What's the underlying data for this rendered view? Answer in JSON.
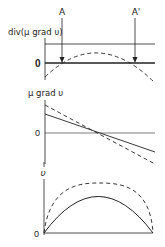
{
  "figure": {
    "colors": {
      "ink": "#222222",
      "background": "#ffffff"
    },
    "markers": [
      {
        "label": "A",
        "x": 62
      },
      {
        "label": "A'",
        "x": 135
      }
    ],
    "panels": [
      {
        "id": "top",
        "ylabel": "div(μ grad υ)",
        "zero_label": "0",
        "curves": [
          {
            "style": "dashed",
            "shape": "downward parabola crossing zero at A and A'"
          }
        ],
        "reference_lines": [
          "upper horizontal line",
          "zero line (bold)"
        ]
      },
      {
        "id": "middle",
        "ylabel": "μ grad υ",
        "zero_label": "0",
        "curves": [
          {
            "style": "solid",
            "shape": "decreasing straight line"
          },
          {
            "style": "dashed",
            "shape": "decreasing line, steeper"
          }
        ]
      },
      {
        "id": "bottom",
        "ylabel": "υ",
        "zero_label": "0",
        "curves": [
          {
            "style": "solid",
            "shape": "parabolic arc, lower peak"
          },
          {
            "style": "dashed",
            "shape": "flatter arc, higher peak"
          }
        ]
      }
    ]
  }
}
